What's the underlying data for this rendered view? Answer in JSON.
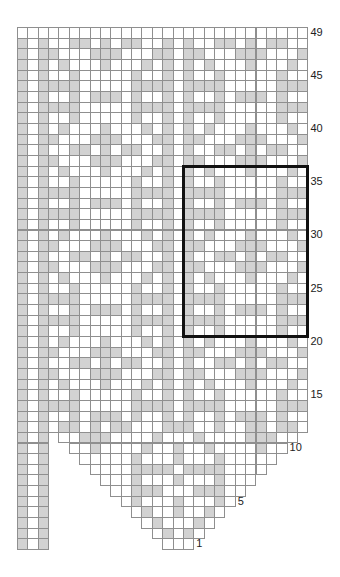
{
  "chart_data": {
    "type": "knitting-chart",
    "title": "",
    "columns": 28,
    "rows_count": 49,
    "colors": {
      "gray_cell": "#d2d2d2",
      "white_cell": "#ffffff",
      "grid_line": "#8f8f8f",
      "highlight_box": "#111111"
    },
    "legend": {
      "G": "shaded stitch",
      "W": "plain stitch",
      ".": "no stitch"
    },
    "row_labels": [
      {
        "row": 49,
        "text": "49",
        "side": "right"
      },
      {
        "row": 45,
        "text": "45",
        "side": "right"
      },
      {
        "row": 40,
        "text": "40",
        "side": "right"
      },
      {
        "row": 35,
        "text": "35",
        "side": "right"
      },
      {
        "row": 30,
        "text": "30",
        "side": "right"
      },
      {
        "row": 25,
        "text": "25",
        "side": "right"
      },
      {
        "row": 20,
        "text": "20",
        "side": "right"
      },
      {
        "row": 15,
        "text": "15",
        "side": "right"
      },
      {
        "row": 10,
        "text": "10",
        "side": "edge"
      },
      {
        "row": 5,
        "text": "5",
        "side": "edge"
      },
      {
        "row": 1,
        "text": "1",
        "side": "edge"
      }
    ],
    "highlight_box": {
      "col_start": 17,
      "col_end": 28,
      "row_start": 21,
      "row_end": 36
    },
    "rows": {
      "49": "WWWWWWWWWWWWWWWWWWWWWWWWWWWW",
      "48": "GWGWWGGWGWGGWWGWGWWGGWGWGGWW",
      "47": "GWGGWWWGGGWWWGGWGGWWWGGGWWWG",
      "46": "GWGWGWWWGWWWGWGWGWGWWWGWWWGW",
      "45": "GWGWWGWWWWWGWWGWGWWGWWWWWGWW",
      "44": "GWGGGGWWWWWGGGGWGGGGWWWWWGGG",
      "43": "GWGWWGWGGGWGWWGWGWWGWGGGWGWW",
      "42": "GWGGGGWWWWWGGGGWGGGGWWWWWGGG",
      "41": "GWGWWGWWWWWGWWGWGWWGWWWWWGWW",
      "40": "GWGWGWWWGWWWGWGWGWGWWWGWWWGW",
      "39": "GWGGWWWGGGWWWGGWGGWWWGGGWWWG",
      "38": "GWGWWGGWGWGGWWGWGWWGGWGWGGWW",
      "37": "GWGGWWWGGGWWWGGWGGWWWGGGWWWG",
      "36": "GWGWGWWWGWWWGWGWGWGWWWGWWWGW",
      "35": "GWGWWGWWWWWGWWGWGWWGWWWWWGWW",
      "34": "GWGGGGWWWWWGGGGWGGGGWWWWWGGG",
      "33": "GWGWWGWGGGWGWWGWGWWGWGGGWGWW",
      "32": "GWGGGGWWWWWGGGGWGGGGWWWWWGGG",
      "31": "GWGWWGWWWWWGWWGWGWWGWWWWWGWW",
      "30": "GWGWGWWWGWWWGWGWGWGWWWGWWWGW",
      "29": "GWGGWWWGGGWWWGGWGGWWWGGGWWWG",
      "28": "GWGWWGGWGWGGWWGWGWWGGWGWGGWW",
      "27": "GWGGWWWGGGWWWGGWGGWWWGGGWWWG",
      "26": "GWGWGWWWGWWWGWGWGWGWWWGWWWGW",
      "25": "GWGWWGWWWWWGWWGWGWWGWWWWWGWW",
      "24": "GWGGGGWWWWWGGGGWGGGGWWWWWGGG",
      "23": "GWGWWGWGGGWGWWGWGWWGWGGGWGWW",
      "22": "GWGGGGWWWWWGGGGWGGGGWWWWWGGG",
      "21": "GWGWWGWWWWWGWWGWGWWGWWWWWGWW",
      "20": "GWGWGWWWGWWWGWGWGWGWWWGWWWGW",
      "19": "GWGGWWWGGGWWWGGWGGWWWGGGWWWG",
      "18": "GWGWWGGWGWGGWWGWGWWGGWGWGGWW",
      "17": "GWGGWWWGGGWWWGGWGGWWWGGGWWWG",
      "16": "GWGWGWWWGWWWGWGWGWGWWWGWWWGW",
      "15": "GWGWWGWWWWWGWWGWGWWGWWWWWGWW",
      "14": "GWGGGGWWWWWGGGGWGGGGWWWWWGGG",
      "13": "GWGWWGWGGGWGWWGWGWWGWGGGWGWW",
      "12": "GWGWGGWGWGGWWWGGGWWGWWGGWGGW",
      "11": "GWG.WWGGGWWWWGWWWGWWWWGGGWW.",
      "10": "GWG..WWGWWWWGWWGWWGWWWWGWW..",
      "9": "GWG...WWWWWGWWWGWWWGWWWWW...",
      "8": "GWG....WWWWGGGGWGGGGWWWW....",
      "7": "GWG.....WWWGWWWGWWWGWWW.....",
      "6": "GWG......WWGGGWWWGGGWW......",
      "5": "GWG.......WGWWWGWWWGW.......",
      "4": "GWG........WGWWGWWGW........",
      "3": "GWG.........WGWWWGW.........",
      "2": "GWG..........WGWGW..........",
      "1": "GWG...........WWW..........."
    }
  }
}
